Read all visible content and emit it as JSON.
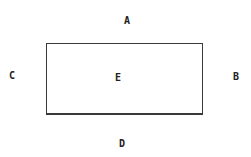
{
  "diagram": {
    "shape": "rectangle",
    "border_color": "#3a3a3a",
    "labels": {
      "top": "A",
      "right": "B",
      "left": "C",
      "bottom": "D",
      "center": "E"
    }
  }
}
